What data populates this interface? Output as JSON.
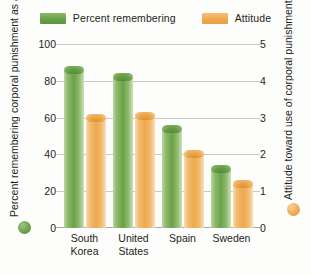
{
  "legend": {
    "items": [
      {
        "label": "Percent remembering",
        "color": "#6ba04a",
        "key": "green"
      },
      {
        "label": "Attitude",
        "color": "#eda94e",
        "key": "orange"
      }
    ]
  },
  "axes": {
    "left": {
      "title": "Percent remembering corporal punishment as a child",
      "ticks": [
        100,
        80,
        60,
        40,
        20,
        0
      ],
      "min": 0,
      "max": 100,
      "marker_color": "#6ba04a"
    },
    "right": {
      "title": "Attitude toward use of corporal punishment",
      "ticks": [
        5,
        4,
        3,
        2,
        1,
        0
      ],
      "min": 0,
      "max": 5,
      "marker_color": "#eda94e"
    }
  },
  "chart_data": {
    "type": "bar",
    "title": "",
    "subtitle": "",
    "xlabel": "",
    "ylabel": "Percent remembering corporal punishment as a child",
    "y2label": "Attitude toward use of corporal punishment",
    "categories": [
      "South Korea",
      "United States",
      "Spain",
      "Sweden"
    ],
    "category_lines": [
      [
        "South",
        "Korea"
      ],
      [
        "United",
        "States"
      ],
      [
        "Spain"
      ],
      [
        "Sweden"
      ]
    ],
    "ylim": [
      0,
      100
    ],
    "y2lim": [
      0,
      5
    ],
    "yticks": [
      0,
      20,
      40,
      60,
      80,
      100
    ],
    "y2ticks": [
      0,
      1,
      2,
      3,
      4,
      5
    ],
    "grid": true,
    "legend_position": "top",
    "series": [
      {
        "name": "Percent remembering",
        "axis": "left",
        "color": "#6ba04a",
        "values": [
          86,
          82,
          54,
          32
        ]
      },
      {
        "name": "Attitude",
        "axis": "right",
        "color": "#eda94e",
        "values": [
          3.0,
          3.05,
          2.0,
          1.2
        ]
      }
    ]
  }
}
